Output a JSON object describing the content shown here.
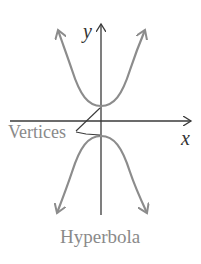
{
  "diagram": {
    "title": "Hyperbola",
    "axes": {
      "x_label": "x",
      "y_label": "y"
    },
    "annotation": "Vertices",
    "colors": {
      "curve": "#8c8c8c",
      "axis": "#3a3a3a",
      "label": "#8a8a8a",
      "axis_label": "#333333"
    }
  }
}
